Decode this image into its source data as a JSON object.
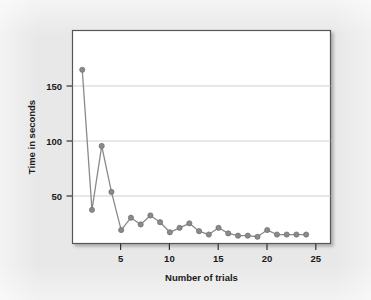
{
  "figure": {
    "background_color": "#e8e8e8",
    "plot_background_color": "#ffffff",
    "border_color": "#555555",
    "shadow": true
  },
  "chart_data": {
    "type": "line",
    "title": "",
    "subtitle": "",
    "xlabel": "Number of trials",
    "ylabel": "Time in seconds",
    "xlim": [
      0,
      26.5
    ],
    "ylim": [
      0,
      190
    ],
    "xticks": [
      5,
      10,
      15,
      20,
      25
    ],
    "xtick_labels": [
      "5",
      "10",
      "15",
      "20",
      "25"
    ],
    "yticks": [
      50,
      100,
      150
    ],
    "ytick_labels": [
      "50",
      "100",
      "150"
    ],
    "grid": "horizontal",
    "grid_color": "#c9c9c9",
    "legend": null,
    "legend_position": "none",
    "marker": "circle",
    "marker_size": 4.6,
    "line_color": "#8a8a8a",
    "marker_color": "#8a8a8a",
    "marker_edge_color": "#6f6f6f",
    "line_width": 1.3,
    "x": [
      1,
      2,
      3,
      4,
      5,
      6,
      7,
      8,
      9,
      10,
      11,
      12,
      13,
      14,
      15,
      16,
      17,
      18,
      19,
      20,
      21,
      22,
      23,
      24
    ],
    "y": [
      155,
      30,
      87,
      46,
      12,
      23,
      17,
      25,
      19,
      10,
      14,
      18,
      11,
      8,
      14,
      9,
      7,
      7,
      6,
      12,
      8,
      8,
      8,
      8
    ],
    "series": [
      {
        "name": "Time in seconds",
        "values": [
          155,
          30,
          87,
          46,
          12,
          23,
          17,
          25,
          19,
          10,
          14,
          18,
          11,
          8,
          14,
          9,
          7,
          7,
          6,
          12,
          8,
          8,
          8,
          8
        ]
      }
    ]
  },
  "labels": {
    "x_axis_title": "Number of trials",
    "y_axis_title": "Time in seconds"
  }
}
